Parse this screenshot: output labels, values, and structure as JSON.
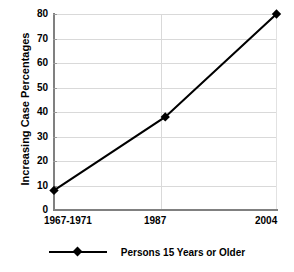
{
  "chart_data": {
    "type": "line",
    "title": "",
    "xlabel": "",
    "ylabel": "Increasing Case Percentages",
    "categories": [
      "1967-1971",
      "1987",
      "2004"
    ],
    "series": [
      {
        "name": "Persons 15 Years or Older",
        "values": [
          8,
          38,
          80
        ],
        "color": "#000000",
        "marker": "square"
      }
    ],
    "ylim": [
      0,
      80
    ],
    "yticks": [
      0,
      10,
      20,
      30,
      40,
      50,
      60,
      70,
      80
    ],
    "ytick_labels": [
      "0",
      "10",
      "20",
      "30",
      "40",
      "50",
      "60",
      "70",
      "80"
    ],
    "grid": true,
    "legend_position": "bottom"
  },
  "legend": {
    "entries": [
      {
        "label": "Persons 15 Years or Older"
      }
    ]
  },
  "axes": {
    "y_title": "Increasing Case Percentages",
    "x_labels": [
      "1967-1971",
      "1987",
      "2004"
    ],
    "y_labels": [
      "80",
      "70",
      "60",
      "50",
      "40",
      "30",
      "20",
      "10",
      "0"
    ]
  },
  "colors": {
    "series": "#000000",
    "grid": "#d9d9d9",
    "axis": "#808080",
    "background": "#ffffff"
  }
}
